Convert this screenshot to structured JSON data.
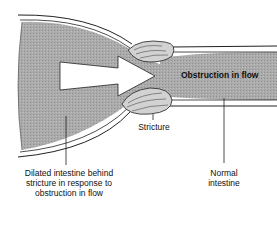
{
  "diagram": {
    "type": "anatomical-diagram",
    "colors": {
      "tissue_fill": "#a9a9a9",
      "wall_outline": "#222222",
      "stricture_fill": "#cfcfcf",
      "arrow_fill": "#ffffff",
      "background": "#ffffff"
    },
    "labels": {
      "obstruction": "Obstruction in flow",
      "stricture": "Stricture",
      "dilated_line1": "Dilated intestine behind",
      "dilated_line2": "stricture in response to",
      "dilated_line3": "obstruction in flow",
      "normal_line1": "Normal",
      "normal_line2": "intestine"
    }
  }
}
